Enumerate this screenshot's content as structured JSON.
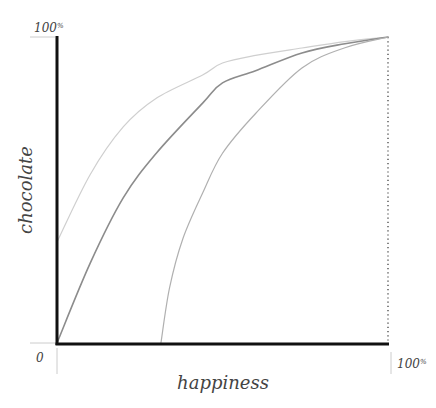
{
  "chart_data": {
    "type": "line",
    "title": "",
    "xlabel": "happiness",
    "ylabel": "chocolate",
    "xlim": [
      0,
      100
    ],
    "ylim": [
      0,
      100
    ],
    "grid": false,
    "legend": null,
    "x_tick_labels": [
      {
        "value": 0,
        "label": "0"
      },
      {
        "value": 100,
        "label": "100%"
      }
    ],
    "y_tick_labels": [
      {
        "value": 100,
        "label": "100%"
      }
    ],
    "reference_lines": [
      {
        "type": "vertical",
        "x": 100,
        "style": "dotted",
        "color": "#333333"
      }
    ],
    "series": [
      {
        "name": "upper curve",
        "color": "#cfcfcf",
        "stroke_width": 1.2,
        "points": [
          [
            0,
            33
          ],
          [
            10,
            55
          ],
          [
            20,
            70.6
          ],
          [
            30,
            80
          ],
          [
            44,
            87.6
          ],
          [
            50,
            91.5
          ],
          [
            60,
            94
          ],
          [
            74,
            96.4
          ],
          [
            87,
            98.5
          ],
          [
            100,
            100
          ]
        ]
      },
      {
        "name": "middle curve",
        "color": "#8c8c8c",
        "stroke_width": 1.6,
        "points": [
          [
            0,
            0
          ],
          [
            10,
            26
          ],
          [
            20,
            47.4
          ],
          [
            30,
            62
          ],
          [
            44,
            78.4
          ],
          [
            50,
            85
          ],
          [
            60,
            89
          ],
          [
            74,
            94.8
          ],
          [
            87,
            97.8
          ],
          [
            100,
            100
          ]
        ]
      },
      {
        "name": "lower curve",
        "color": "#b0b0b0",
        "stroke_width": 1.2,
        "points": [
          [
            31.4,
            0
          ],
          [
            34,
            18
          ],
          [
            38,
            34
          ],
          [
            44,
            49
          ],
          [
            50,
            62
          ],
          [
            60,
            75
          ],
          [
            74,
            89.9
          ],
          [
            87,
            96.5
          ],
          [
            100,
            100
          ]
        ]
      }
    ]
  },
  "labels": {
    "y_top": "100",
    "y_top_suffix": "%",
    "x_origin": "0",
    "x_right": "100",
    "x_right_suffix": "%",
    "x_axis_title": "happiness",
    "y_axis_title": "chocolate"
  }
}
